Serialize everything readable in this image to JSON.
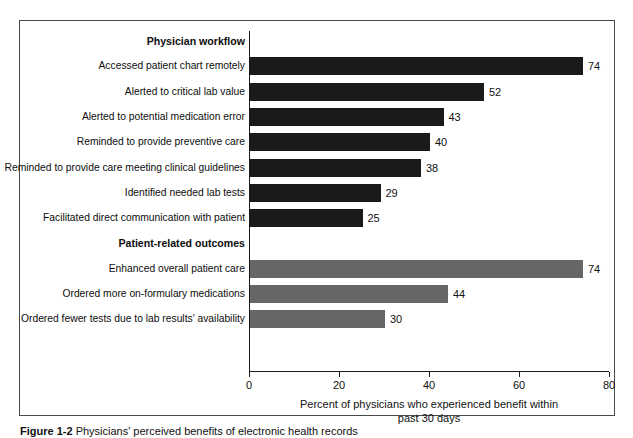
{
  "figure": {
    "caption_label": "Figure 1-2",
    "caption_text": "Physicians' perceived benefits of electronic health records"
  },
  "chart_data": {
    "type": "bar",
    "orientation": "horizontal",
    "title": "",
    "subtitle": "",
    "xlabel": "Percent of physicians who experienced benefit within past 30 days",
    "xlabel_line1": "Percent of physicians who experienced benefit within",
    "xlabel_line2": "past 30 days",
    "ylabel": "",
    "xlim": [
      0,
      80
    ],
    "xticks": [
      0,
      20,
      40,
      60,
      80
    ],
    "xtick_labels": [
      "0",
      "20",
      "40",
      "60",
      "80"
    ],
    "grid": false,
    "legend": false,
    "value_label_suffix": "",
    "groups": [
      {
        "header": "Physician workflow",
        "color": "#1a1a1a",
        "color_name": "dark",
        "categories": [
          "Accessed patient chart remotely",
          "Alerted to critical lab value",
          "Alerted to potential medication error",
          "Reminded to provide preventive care",
          "Reminded to provide care meeting clinical guidelines",
          "Identified needed lab tests",
          "Facilitated direct communication with patient"
        ],
        "values": [
          74,
          52,
          43,
          40,
          38,
          29,
          25
        ]
      },
      {
        "header": "Patient-related outcomes",
        "color": "#666666",
        "color_name": "gray",
        "categories": [
          "Enhanced overall patient care",
          "Ordered more on-formulary medications",
          "Ordered fewer tests due to lab results' availability"
        ],
        "values": [
          74,
          44,
          30
        ]
      }
    ]
  }
}
